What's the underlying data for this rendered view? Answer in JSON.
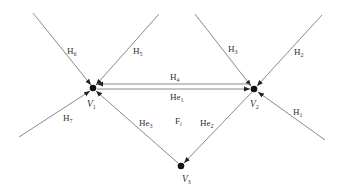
{
  "diagram": {
    "type": "half-edge face diagram",
    "vertices": [
      {
        "id": "V1",
        "label": "V",
        "sub": "1",
        "x": 93,
        "y": 88
      },
      {
        "id": "V2",
        "label": "V",
        "sub": "2",
        "x": 254,
        "y": 89
      },
      {
        "id": "V3",
        "label": "V",
        "sub": "3",
        "x": 181,
        "y": 166
      }
    ],
    "face": {
      "label": "F",
      "sub": "i"
    },
    "half_edges": [
      {
        "label": "H",
        "sub": "1",
        "from": [
          325,
          140
        ],
        "to": "V2"
      },
      {
        "label": "H",
        "sub": "2",
        "from": [
          322,
          15
        ],
        "to": "V2"
      },
      {
        "label": "H",
        "sub": "3",
        "from": [
          195,
          14
        ],
        "to": "V2"
      },
      {
        "label": "H",
        "sub": "4",
        "from": "V2",
        "to": "V1"
      },
      {
        "label": "H",
        "sub": "5",
        "from": [
          159,
          14
        ],
        "to": "V1"
      },
      {
        "label": "H",
        "sub": "6",
        "from": [
          33,
          13
        ],
        "to": "V1"
      },
      {
        "label": "H",
        "sub": "7",
        "from": [
          19,
          137
        ],
        "to": "V1"
      },
      {
        "label": "He",
        "sub": "1",
        "from": "V1",
        "to": "V2"
      },
      {
        "label": "He",
        "sub": "2",
        "from": "V2",
        "to": "V3"
      },
      {
        "label": "He",
        "sub": "3",
        "from": "V3",
        "to": "V1"
      }
    ],
    "colors": {
      "edge": "#8a8a8a",
      "vertex": "#111111",
      "text": "#333333"
    }
  }
}
